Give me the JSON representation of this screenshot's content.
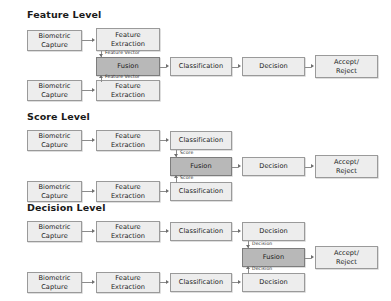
{
  "figure": {
    "colors": {
      "node_fill": "#ededed",
      "fusion_fill": "#b8b8b8",
      "node_border": "#9a9a9a",
      "connector": "#8c8c8c",
      "background": "#ffffff",
      "text": "#1a1a1a"
    }
  },
  "sections": [
    {
      "id": "feature-level",
      "title": "Feature Level",
      "fusion_label": "Fusion",
      "edge_label": "Feature Vector",
      "accept_label": "Accept/\nReject",
      "top_chain": [
        "Biometric\nCapture",
        "Feature\nExtraction"
      ],
      "bottom_chain": [
        "Biometric\nCapture",
        "Feature\nExtraction"
      ],
      "post_fusion_chain": [
        "Classification",
        "Decision"
      ]
    },
    {
      "id": "score-level",
      "title": "Score Level",
      "fusion_label": "Fusion",
      "edge_label": "Score",
      "accept_label": "Accept/\nReject",
      "top_chain": [
        "Biometric\nCapture",
        "Feature\nExtraction",
        "Classification"
      ],
      "bottom_chain": [
        "Biometric\nCapture",
        "Feature\nExtraction",
        "Classification"
      ],
      "post_fusion_chain": [
        "Decision"
      ]
    },
    {
      "id": "decision-level",
      "title": "Decision Level",
      "fusion_label": "Fusion",
      "edge_label": "Decision",
      "accept_label": "Accept/\nReject",
      "top_chain": [
        "Biometric\nCapture",
        "Feature\nExtraction",
        "Classification",
        "Decision"
      ],
      "bottom_chain": [
        "Biometric\nCapture",
        "Feature\nExtraction",
        "Classification",
        "Decision"
      ],
      "post_fusion_chain": []
    }
  ],
  "nodes": {
    "f_title": "Feature Level",
    "f_cap_top": "Biometric\nCapture",
    "f_ext_top": "Feature\nExtraction",
    "f_cap_bot": "Biometric\nCapture",
    "f_ext_bot": "Feature\nExtraction",
    "f_fusion": "Fusion",
    "f_class": "Classification",
    "f_dec": "Decision",
    "f_accept": "Accept/\nReject",
    "f_lbl_top": "Feature Vector",
    "f_lbl_bot": "Feature Vector",
    "s_title": "Score Level",
    "s_cap_top": "Biometric\nCapture",
    "s_ext_top": "Feature\nExtraction",
    "s_class_top": "Classification",
    "s_cap_bot": "Biometric\nCapture",
    "s_ext_bot": "Feature\nExtraction",
    "s_class_bot": "Classification",
    "s_fusion": "Fusion",
    "s_dec": "Decision",
    "s_accept": "Accept/\nReject",
    "s_lbl_top": "Score",
    "s_lbl_bot": "Score",
    "d_title": "Decision Level",
    "d_cap_top": "Biometric\nCapture",
    "d_ext_top": "Feature\nExtraction",
    "d_class_top": "Classification",
    "d_dec_top": "Decision",
    "d_cap_bot": "Biometric\nCapture",
    "d_ext_bot": "Feature\nExtraction",
    "d_class_bot": "Classification",
    "d_dec_bot": "Decision",
    "d_fusion": "Fusion",
    "d_accept": "Accept/\nReject",
    "d_lbl_top": "Decision",
    "d_lbl_bot": "Decision"
  }
}
